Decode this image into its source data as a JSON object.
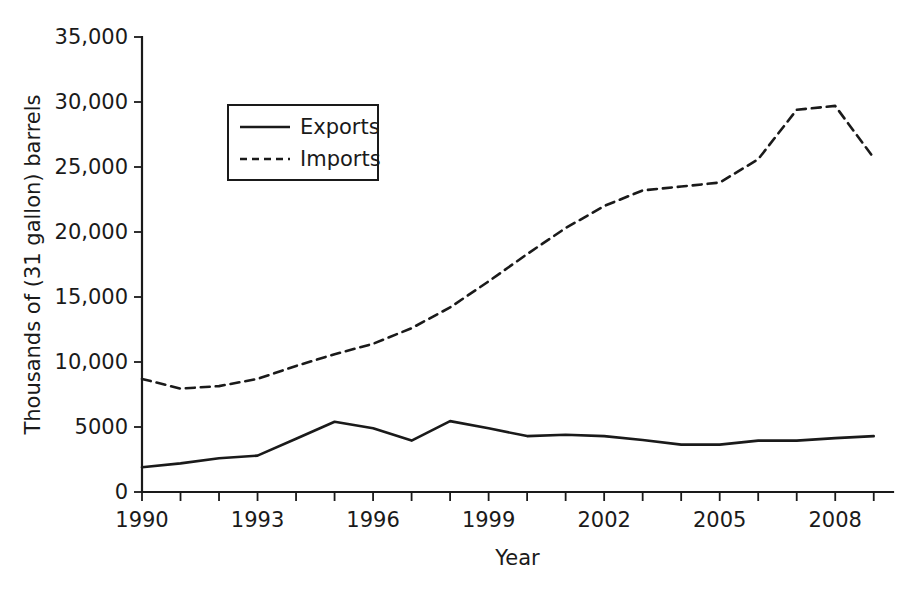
{
  "chart_data": {
    "type": "line",
    "title": "",
    "xlabel": "Year",
    "ylabel": "Thousands of (31 gallon) barrels",
    "xlim": [
      1990,
      2009.5
    ],
    "ylim": [
      0,
      35000
    ],
    "grid": false,
    "legend_position": "upper-left-inside",
    "x": [
      1990,
      1991,
      1992,
      1993,
      1994,
      1995,
      1996,
      1997,
      1998,
      1999,
      2000,
      2001,
      2002,
      2003,
      2004,
      2005,
      2006,
      2007,
      2008,
      2009
    ],
    "xtick_values": [
      1990,
      1991,
      1992,
      1993,
      1994,
      1995,
      1996,
      1997,
      1998,
      1999,
      2000,
      2001,
      2002,
      2003,
      2004,
      2005,
      2006,
      2007,
      2008,
      2009
    ],
    "xtick_labels": [
      "1990",
      "",
      "",
      "1993",
      "",
      "",
      "1996",
      "",
      "",
      "1999",
      "",
      "",
      "2002",
      "",
      "",
      "2005",
      "",
      "",
      "2008",
      ""
    ],
    "ytick_values": [
      0,
      5000,
      10000,
      15000,
      20000,
      25000,
      30000,
      35000
    ],
    "ytick_labels": [
      "0",
      "5000",
      "10,000",
      "15,000",
      "20,000",
      "25,000",
      "30,000",
      "35,000"
    ],
    "series": [
      {
        "name": "Exports",
        "style": "solid",
        "color": "#1a1a1a",
        "values": [
          1900,
          2200,
          2600,
          2800,
          4100,
          5400,
          4900,
          3950,
          5450,
          4900,
          4300,
          4400,
          4300,
          4000,
          3650,
          3650,
          3950,
          3950,
          4150,
          4300
        ]
      },
      {
        "name": "Imports",
        "style": "dashed",
        "color": "#1a1a1a",
        "values": [
          8700,
          7950,
          8150,
          8700,
          9700,
          10600,
          11400,
          12600,
          14200,
          16200,
          18300,
          20300,
          22000,
          23200,
          23500,
          23800,
          25600,
          29400,
          29700,
          25700
        ]
      }
    ],
    "legend": [
      {
        "label": "Exports",
        "style": "solid"
      },
      {
        "label": "Imports",
        "style": "dashed"
      }
    ]
  },
  "layout": {
    "plot_left": 142,
    "plot_right": 893,
    "plot_top": 37,
    "plot_bottom": 492,
    "legend_rect": {
      "x": 228,
      "y": 105,
      "w": 150,
      "h": 75
    }
  }
}
